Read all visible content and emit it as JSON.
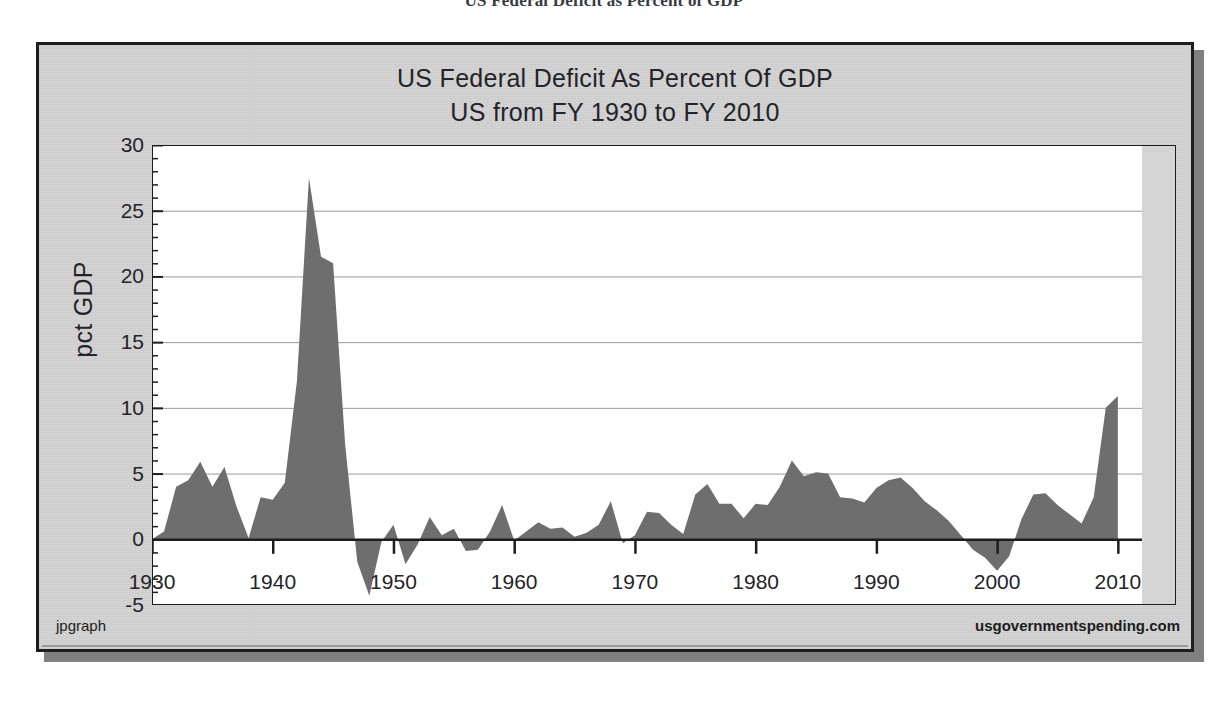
{
  "page": {
    "header_title": "US Federal Deficit as Percent of GDP"
  },
  "chart": {
    "title_line1": "US Federal Deficit As Percent Of GDP",
    "title_line2": "US from FY 1930 to FY 2010",
    "ylabel": "pct GDP",
    "footer_left": "jpgraph",
    "footer_right": "usgovernmentspending.com",
    "colors": {
      "frame_background": "#d4d4d4",
      "frame_border": "#1d1d1d",
      "plot_background": "#ffffff",
      "area_fill": "#6e6e6e",
      "gridline": "#9a9a9a",
      "axis": "#1d1d1d",
      "text": "#242428",
      "shadow": "#808080"
    }
  },
  "chart_data": {
    "type": "area",
    "title": "US Federal Deficit As Percent Of GDP",
    "subtitle": "US from FY 1930 to FY 2010",
    "xlabel": "",
    "ylabel": "pct GDP",
    "xlim": [
      1930,
      2012
    ],
    "ylim": [
      -5,
      30
    ],
    "yticks": [
      -5,
      0,
      5,
      10,
      15,
      20,
      25,
      30
    ],
    "xticks": [
      1930,
      1940,
      1950,
      1960,
      1970,
      1980,
      1990,
      2000,
      2010
    ],
    "grid": true,
    "legend": "none",
    "series_name": "Federal deficit (pct GDP)",
    "x": [
      1930,
      1931,
      1932,
      1933,
      1934,
      1935,
      1936,
      1937,
      1938,
      1939,
      1940,
      1941,
      1942,
      1943,
      1944,
      1945,
      1946,
      1947,
      1948,
      1949,
      1950,
      1951,
      1952,
      1953,
      1954,
      1955,
      1956,
      1957,
      1958,
      1959,
      1960,
      1961,
      1962,
      1963,
      1964,
      1965,
      1966,
      1967,
      1968,
      1969,
      1970,
      1971,
      1972,
      1973,
      1974,
      1975,
      1976,
      1977,
      1978,
      1979,
      1980,
      1981,
      1982,
      1983,
      1984,
      1985,
      1986,
      1987,
      1988,
      1989,
      1990,
      1991,
      1992,
      1993,
      1994,
      1995,
      1996,
      1997,
      1998,
      1999,
      2000,
      2001,
      2002,
      2003,
      2004,
      2005,
      2006,
      2007,
      2008,
      2009,
      2010
    ],
    "values": [
      0.0,
      0.6,
      4.0,
      4.5,
      5.9,
      4.0,
      5.5,
      2.5,
      0.1,
      3.2,
      3.0,
      4.3,
      12.0,
      27.5,
      21.5,
      21.0,
      7.2,
      -1.7,
      -4.3,
      -0.2,
      1.1,
      -1.9,
      -0.4,
      1.7,
      0.3,
      0.8,
      -0.9,
      -0.8,
      0.6,
      2.6,
      -0.1,
      0.6,
      1.3,
      0.8,
      0.9,
      0.2,
      0.5,
      1.1,
      2.9,
      -0.3,
      0.3,
      2.1,
      2.0,
      1.1,
      0.4,
      3.4,
      4.2,
      2.7,
      2.7,
      1.6,
      2.7,
      2.6,
      4.0,
      6.0,
      4.8,
      5.1,
      5.0,
      3.2,
      3.1,
      2.8,
      3.9,
      4.5,
      4.7,
      3.9,
      2.9,
      2.2,
      1.4,
      0.3,
      -0.8,
      -1.4,
      -2.4,
      -1.3,
      1.5,
      3.4,
      3.5,
      2.6,
      1.9,
      1.2,
      3.2,
      10.0,
      10.9
    ],
    "annotations": [
      {
        "label": "WWII peak",
        "x": 1943,
        "y": 27.5
      },
      {
        "label": "post-war surplus",
        "x": 1948,
        "y": -4.3
      },
      {
        "label": "1983 deficit peak",
        "x": 1983,
        "y": 6.0
      },
      {
        "label": "2000 surplus",
        "x": 2000,
        "y": -2.4
      },
      {
        "label": "2010 deficit",
        "x": 2010,
        "y": 10.9
      }
    ]
  }
}
